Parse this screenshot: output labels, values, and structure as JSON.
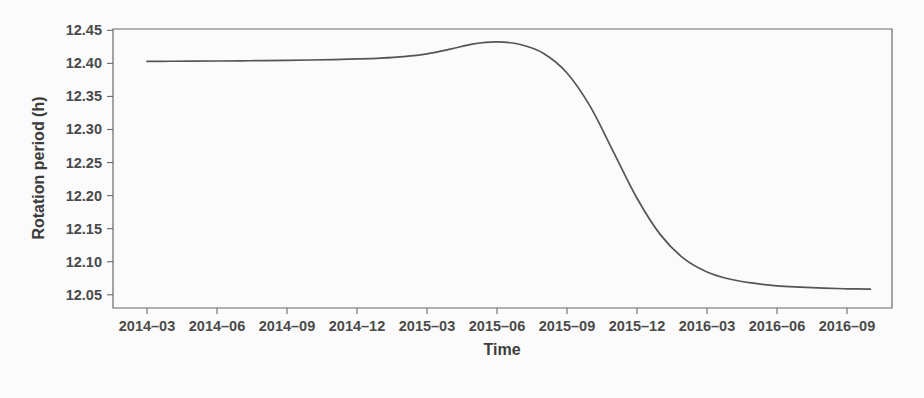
{
  "chart_data": {
    "type": "line",
    "title": "",
    "xlabel": "Time",
    "ylabel": "Rotation period (h)",
    "grid": false,
    "legend": null,
    "line_color": "#555555",
    "background_color": "#fbfbfb",
    "axis_color": "#6a6a6a",
    "xlim": [
      "2014-02",
      "2016-10"
    ],
    "ylim": [
      12.03,
      12.452
    ],
    "x_tick_labels": [
      "2014–03",
      "2014–06",
      "2014–09",
      "2014–12",
      "2015–03",
      "2015–06",
      "2015–09",
      "2015–12",
      "2016–03",
      "2016–06",
      "2016–09"
    ],
    "y_tick_labels": [
      "12.45",
      "12.40",
      "12.35",
      "12.30",
      "12.25",
      "12.20",
      "12.15",
      "12.10",
      "12.05"
    ],
    "y_tick_values": [
      12.45,
      12.4,
      12.35,
      12.3,
      12.25,
      12.2,
      12.15,
      12.1,
      12.05
    ],
    "series": [
      {
        "name": "Rotation period",
        "x": [
          "2014-03",
          "2014-04",
          "2014-05",
          "2014-06",
          "2014-07",
          "2014-08",
          "2014-09",
          "2014-10",
          "2014-11",
          "2014-12",
          "2015-01",
          "2015-02",
          "2015-03",
          "2015-04",
          "2015-05",
          "2015-06",
          "2015-07",
          "2015-08",
          "2015-09",
          "2015-10",
          "2015-11",
          "2015-12",
          "2016-01",
          "2016-02",
          "2016-03",
          "2016-04",
          "2016-05",
          "2016-06",
          "2016-07",
          "2016-08",
          "2016-09",
          "2016-10"
        ],
        "values": [
          12.403,
          12.4032,
          12.4034,
          12.4036,
          12.4039,
          12.4042,
          12.4046,
          12.4051,
          12.4058,
          12.4067,
          12.408,
          12.4103,
          12.4145,
          12.4215,
          12.4295,
          12.4325,
          12.4285,
          12.415,
          12.3855,
          12.3345,
          12.2655,
          12.196,
          12.141,
          12.105,
          12.0845,
          12.0735,
          12.0675,
          12.0635,
          12.0615,
          12.06,
          12.059,
          12.0585
        ]
      }
    ],
    "annotations": []
  }
}
